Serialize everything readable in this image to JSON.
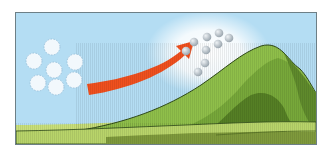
{
  "diagram": {
    "colors": {
      "sky": "#b4ddf3",
      "sky_glow": "#ffffff",
      "arrow": "#f0501e",
      "arrow_stripe": "#e03a10",
      "mountain_light": "#8fbf4a",
      "mountain_mid": "#6f9e35",
      "mountain_dark": "#557f25",
      "ground_light": "#c9e07a",
      "ground_dark": "#7f9a3c",
      "outline": "#2f4a1a",
      "cloud_parcel": "#f2f8fc",
      "cloud_parcel_border": "#9ec3dc",
      "droplet": "#a9b3bb",
      "droplet_highlight": "#e6ebef"
    },
    "elements": {
      "left_parcels": [
        {
          "cx": 36,
          "cy": 34
        },
        {
          "cx": 18,
          "cy": 48
        },
        {
          "cx": 38,
          "cy": 57
        },
        {
          "cx": 59,
          "cy": 49
        },
        {
          "cx": 22,
          "cy": 70
        },
        {
          "cx": 40,
          "cy": 74
        },
        {
          "cx": 58,
          "cy": 67
        }
      ],
      "right_droplets": [
        {
          "cx": 170,
          "cy": 38
        },
        {
          "cx": 178,
          "cy": 29
        },
        {
          "cx": 191,
          "cy": 24
        },
        {
          "cx": 203,
          "cy": 20
        },
        {
          "cx": 176,
          "cy": 47
        },
        {
          "cx": 190,
          "cy": 37
        },
        {
          "cx": 202,
          "cy": 31
        },
        {
          "cx": 213,
          "cy": 25
        },
        {
          "cx": 189,
          "cy": 50
        },
        {
          "cx": 182,
          "cy": 59
        }
      ]
    }
  }
}
